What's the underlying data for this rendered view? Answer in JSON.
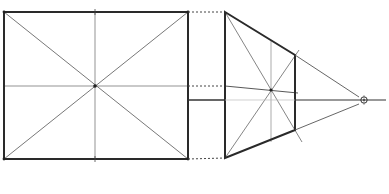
{
  "diagram": {
    "title": "",
    "colors": {
      "background": "#ffffff",
      "heavy_line": "#2a2a2a",
      "thin_line": "#555555",
      "faint_line": "#9a9a9a"
    },
    "front_view": {
      "shape": "rectangle",
      "corners": [
        [
          4,
          12
        ],
        [
          188,
          12
        ],
        [
          188,
          159
        ],
        [
          4,
          159
        ]
      ],
      "center": [
        95,
        86
      ],
      "construction": [
        "diagonals",
        "vertical-midline",
        "horizontal-midline"
      ]
    },
    "perspective_view": {
      "shape": "trapezoid",
      "corners": [
        [
          225,
          12
        ],
        [
          295,
          55
        ],
        [
          295,
          130
        ],
        [
          225,
          158
        ]
      ],
      "center": [
        271,
        90
      ],
      "construction": [
        "diagonals",
        "vertical-midline",
        "horizontal-midline"
      ]
    },
    "horizon_line": {
      "y": 100,
      "x_start": 188,
      "x_end": 386
    },
    "vanishing_point": {
      "x": 364,
      "y": 100,
      "label": ""
    },
    "projection_lines": [
      "top-edge-dashed",
      "midline-dashed",
      "bottom-edge-dashed"
    ]
  }
}
